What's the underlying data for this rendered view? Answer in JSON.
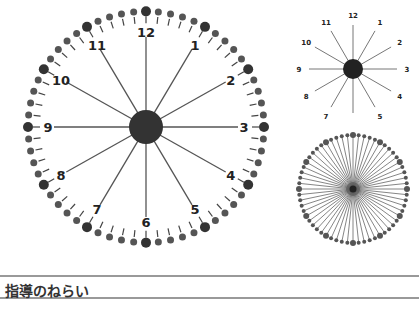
{
  "diagrams": {
    "large_clock": {
      "numerals": [
        "12",
        "1",
        "2",
        "3",
        "4",
        "5",
        "6",
        "7",
        "8",
        "9",
        "10",
        "11"
      ],
      "minute_beads": 60,
      "hub_color": "#333333",
      "bead_color": "#555555"
    },
    "small_clock": {
      "numerals": [
        "12",
        "1",
        "2",
        "3",
        "4",
        "5",
        "6",
        "7",
        "8",
        "9",
        "10",
        "11"
      ],
      "hub_color": "#222222"
    },
    "minute_clock": {
      "spokes": 60,
      "hub_color": "#222222"
    }
  },
  "section": {
    "title": "指導のねらい"
  }
}
